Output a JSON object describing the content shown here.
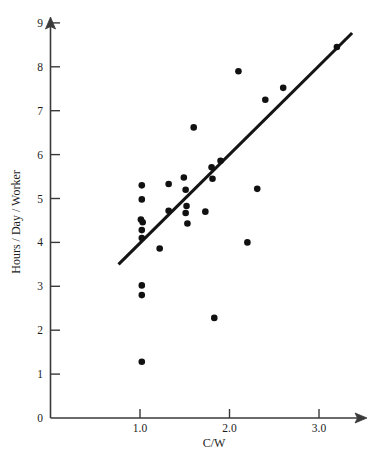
{
  "chart_data": {
    "type": "scatter",
    "title": "",
    "xlabel": "C/W",
    "ylabel": "Hours / Day / Worker",
    "xlim": [
      0.0,
      3.55
    ],
    "ylim": [
      0,
      9
    ],
    "grid": false,
    "legend": "none",
    "x_ticks": [
      {
        "value": 1.0,
        "label": "1.0"
      },
      {
        "value": 2.0,
        "label": "2.0"
      },
      {
        "value": 3.0,
        "label": "3.0"
      }
    ],
    "y_ticks": [
      {
        "value": 0,
        "label": "0"
      },
      {
        "value": 1,
        "label": "1"
      },
      {
        "value": 2,
        "label": "2"
      },
      {
        "value": 3,
        "label": "3"
      },
      {
        "value": 4,
        "label": "4"
      },
      {
        "value": 5,
        "label": "5"
      },
      {
        "value": 6,
        "label": "6"
      },
      {
        "value": 7,
        "label": "7"
      },
      {
        "value": 8,
        "label": "8"
      },
      {
        "value": 9,
        "label": "9"
      }
    ],
    "points": [
      {
        "x": 1.02,
        "y": 5.3
      },
      {
        "x": 1.02,
        "y": 4.98
      },
      {
        "x": 1.01,
        "y": 4.52
      },
      {
        "x": 1.03,
        "y": 4.46
      },
      {
        "x": 1.02,
        "y": 4.28
      },
      {
        "x": 1.02,
        "y": 4.1
      },
      {
        "x": 1.02,
        "y": 3.02
      },
      {
        "x": 1.02,
        "y": 2.8
      },
      {
        "x": 1.02,
        "y": 1.28
      },
      {
        "x": 1.22,
        "y": 3.86
      },
      {
        "x": 1.32,
        "y": 5.33
      },
      {
        "x": 1.32,
        "y": 4.72
      },
      {
        "x": 1.49,
        "y": 5.48
      },
      {
        "x": 1.51,
        "y": 5.2
      },
      {
        "x": 1.52,
        "y": 4.83
      },
      {
        "x": 1.51,
        "y": 4.67
      },
      {
        "x": 1.53,
        "y": 4.43
      },
      {
        "x": 1.6,
        "y": 6.62
      },
      {
        "x": 1.73,
        "y": 4.7
      },
      {
        "x": 1.8,
        "y": 5.71
      },
      {
        "x": 1.81,
        "y": 5.45
      },
      {
        "x": 1.83,
        "y": 2.28
      },
      {
        "x": 1.9,
        "y": 5.86
      },
      {
        "x": 2.1,
        "y": 7.9
      },
      {
        "x": 2.2,
        "y": 4.0
      },
      {
        "x": 2.31,
        "y": 5.22
      },
      {
        "x": 2.4,
        "y": 7.25
      },
      {
        "x": 2.6,
        "y": 7.52
      },
      {
        "x": 3.2,
        "y": 8.45
      }
    ],
    "fit_line": {
      "x_start": 0.76,
      "y_start": 3.5,
      "x_end": 3.37,
      "y_end": 8.77,
      "style": "solid"
    },
    "colors": {
      "point": "#111111",
      "line": "#141414",
      "axis": "#3a3a3a",
      "text": "#1c1c1c",
      "background": "#ffffff"
    }
  }
}
